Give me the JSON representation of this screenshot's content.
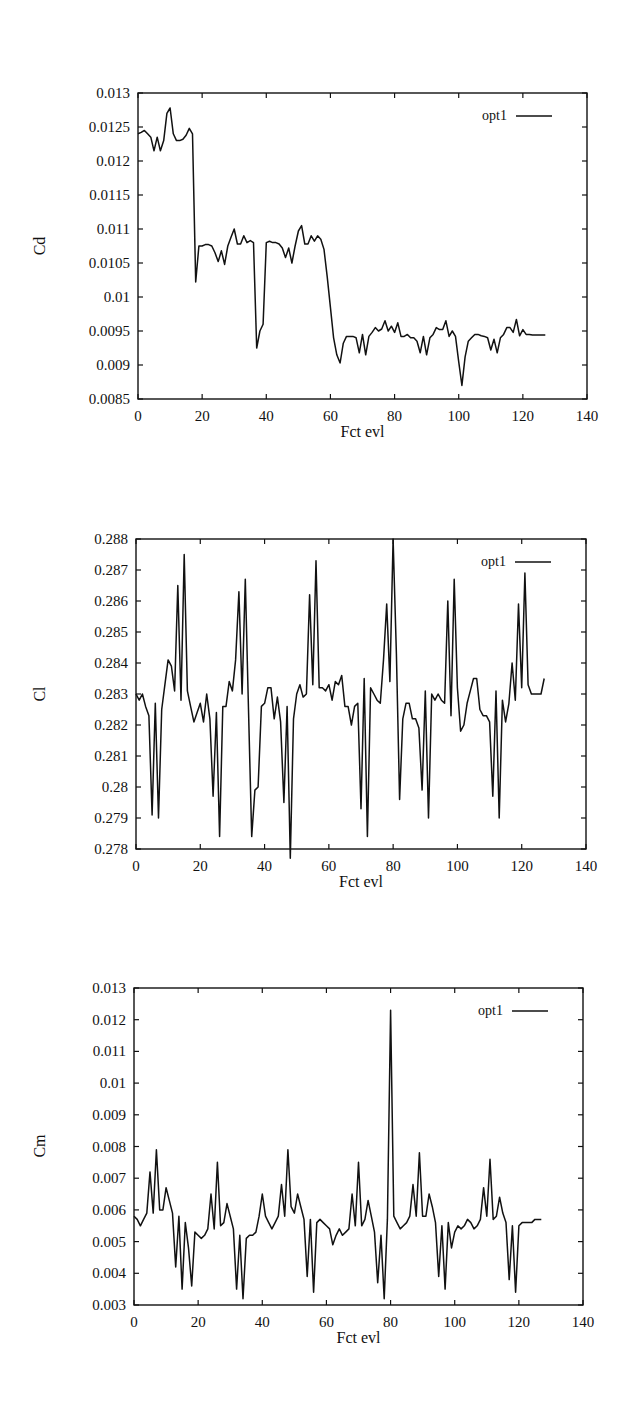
{
  "chart_data": [
    {
      "type": "line",
      "title": "",
      "xlabel": "Fct evl",
      "ylabel": "Cd",
      "xlim": [
        0,
        140
      ],
      "ylim": [
        0.0085,
        0.013
      ],
      "xticks": [
        "0",
        "20",
        "40",
        "60",
        "80",
        "100",
        "120",
        "140"
      ],
      "yticks": [
        "0.0085",
        "0.009",
        "0.0095",
        "0.01",
        "0.0105",
        "0.011",
        "0.0115",
        "0.012",
        "0.0125",
        "0.013"
      ],
      "grid": false,
      "legend_position": "top-right",
      "series": [
        {
          "name": "opt1",
          "x": [
            0,
            1,
            2,
            3,
            4,
            5,
            6,
            7,
            8,
            9,
            10,
            11,
            12,
            13,
            14,
            15,
            16,
            17,
            18,
            19,
            20,
            21,
            22,
            23,
            24,
            25,
            26,
            27,
            28,
            29,
            30,
            31,
            32,
            33,
            34,
            35,
            36,
            37,
            38,
            39,
            40,
            41,
            42,
            43,
            44,
            45,
            46,
            47,
            48,
            49,
            50,
            51,
            52,
            53,
            54,
            55,
            56,
            57,
            58,
            59,
            60,
            61,
            62,
            63,
            64,
            65,
            66,
            67,
            68,
            69,
            70,
            71,
            72,
            73,
            74,
            75,
            76,
            77,
            78,
            79,
            80,
            81,
            82,
            83,
            84,
            85,
            86,
            87,
            88,
            89,
            90,
            91,
            92,
            93,
            94,
            95,
            96,
            97,
            98,
            99,
            100,
            101,
            102,
            103,
            104,
            105,
            106,
            107,
            108,
            109,
            110,
            111,
            112,
            113,
            114,
            115,
            116,
            117,
            118,
            119,
            120,
            121,
            122,
            123,
            124,
            125,
            126,
            127
          ],
          "values": [
            0.0124,
            0.01242,
            0.01245,
            0.0124,
            0.01235,
            0.01215,
            0.01235,
            0.01215,
            0.0123,
            0.0127,
            0.01278,
            0.0124,
            0.0123,
            0.0123,
            0.01232,
            0.01238,
            0.01248,
            0.0124,
            0.01022,
            0.01075,
            0.01075,
            0.01077,
            0.01077,
            0.01075,
            0.01065,
            0.01052,
            0.01068,
            0.01048,
            0.01075,
            0.01088,
            0.011,
            0.01078,
            0.01078,
            0.0109,
            0.0108,
            0.01083,
            0.0108,
            0.00925,
            0.0095,
            0.0096,
            0.0108,
            0.01082,
            0.0108,
            0.0108,
            0.01078,
            0.01072,
            0.01058,
            0.01072,
            0.0105,
            0.01075,
            0.01097,
            0.01105,
            0.01078,
            0.01078,
            0.0109,
            0.01082,
            0.0109,
            0.01085,
            0.0107,
            0.0103,
            0.00985,
            0.0094,
            0.00915,
            0.00903,
            0.00932,
            0.00942,
            0.00942,
            0.00942,
            0.0094,
            0.00918,
            0.00945,
            0.00915,
            0.00942,
            0.00948,
            0.00955,
            0.0095,
            0.00953,
            0.00965,
            0.0095,
            0.00957,
            0.00948,
            0.00962,
            0.00942,
            0.00942,
            0.00945,
            0.0094,
            0.0094,
            0.00935,
            0.00918,
            0.00942,
            0.00915,
            0.0094,
            0.00945,
            0.00955,
            0.00952,
            0.00952,
            0.00965,
            0.00942,
            0.0095,
            0.00942,
            0.00905,
            0.0087,
            0.00912,
            0.00935,
            0.0094,
            0.00945,
            0.00945,
            0.00943,
            0.00942,
            0.0094,
            0.00922,
            0.00938,
            0.00918,
            0.0094,
            0.00945,
            0.00955,
            0.00955,
            0.00948,
            0.00967,
            0.00943,
            0.00952,
            0.00945,
            0.00945,
            0.00944,
            0.00944,
            0.00944,
            0.00944,
            0.00944
          ]
        }
      ]
    },
    {
      "type": "line",
      "title": "",
      "xlabel": "Fct evl",
      "ylabel": "Cl",
      "xlim": [
        0,
        140
      ],
      "ylim": [
        0.278,
        0.288
      ],
      "xticks": [
        "0",
        "20",
        "40",
        "60",
        "80",
        "100",
        "120",
        "140"
      ],
      "yticks": [
        "0.278",
        "0.279",
        "0.28",
        "0.281",
        "0.282",
        "0.283",
        "0.284",
        "0.285",
        "0.286",
        "0.287",
        "0.288"
      ],
      "grid": false,
      "legend_position": "top-right",
      "series": [
        {
          "name": "opt1",
          "x": [
            0,
            1,
            2,
            3,
            4,
            5,
            6,
            7,
            8,
            9,
            10,
            11,
            12,
            13,
            14,
            15,
            16,
            17,
            18,
            19,
            20,
            21,
            22,
            23,
            24,
            25,
            26,
            27,
            28,
            29,
            30,
            31,
            32,
            33,
            34,
            35,
            36,
            37,
            38,
            39,
            40,
            41,
            42,
            43,
            44,
            45,
            46,
            47,
            48,
            49,
            50,
            51,
            52,
            53,
            54,
            55,
            56,
            57,
            58,
            59,
            60,
            61,
            62,
            63,
            64,
            65,
            66,
            67,
            68,
            69,
            70,
            71,
            72,
            73,
            74,
            75,
            76,
            77,
            78,
            79,
            80,
            81,
            82,
            83,
            84,
            85,
            86,
            87,
            88,
            89,
            90,
            91,
            92,
            93,
            94,
            95,
            96,
            97,
            98,
            99,
            100,
            101,
            102,
            103,
            104,
            105,
            106,
            107,
            108,
            109,
            110,
            111,
            112,
            113,
            114,
            115,
            116,
            117,
            118,
            119,
            120,
            121,
            122,
            123,
            124,
            125,
            126,
            127
          ],
          "values": [
            0.283,
            0.2828,
            0.283,
            0.2826,
            0.2823,
            0.2791,
            0.2827,
            0.279,
            0.2825,
            0.2833,
            0.2841,
            0.2839,
            0.2831,
            0.2865,
            0.2828,
            0.2875,
            0.2831,
            0.2826,
            0.2821,
            0.2824,
            0.2827,
            0.2821,
            0.283,
            0.2822,
            0.2797,
            0.2824,
            0.2784,
            0.2826,
            0.2826,
            0.2834,
            0.2831,
            0.2841,
            0.2863,
            0.283,
            0.2867,
            0.2825,
            0.2784,
            0.2799,
            0.28,
            0.2826,
            0.2827,
            0.2832,
            0.2832,
            0.2822,
            0.2829,
            0.2821,
            0.2795,
            0.2826,
            0.2777,
            0.2822,
            0.283,
            0.2833,
            0.2829,
            0.283,
            0.2862,
            0.2833,
            0.2873,
            0.2832,
            0.2832,
            0.2831,
            0.2833,
            0.2828,
            0.2834,
            0.2833,
            0.2836,
            0.2826,
            0.2826,
            0.282,
            0.2826,
            0.2827,
            0.2793,
            0.2835,
            0.2784,
            0.2832,
            0.283,
            0.2828,
            0.2827,
            0.2841,
            0.2859,
            0.2834,
            0.288,
            0.2843,
            0.2796,
            0.2822,
            0.2827,
            0.2827,
            0.2822,
            0.2822,
            0.2819,
            0.2799,
            0.2831,
            0.279,
            0.283,
            0.2828,
            0.283,
            0.2828,
            0.2827,
            0.286,
            0.2823,
            0.2867,
            0.2832,
            0.2818,
            0.282,
            0.2827,
            0.2831,
            0.2835,
            0.2835,
            0.2825,
            0.2823,
            0.2823,
            0.2821,
            0.2797,
            0.2831,
            0.279,
            0.2828,
            0.2821,
            0.2827,
            0.284,
            0.2828,
            0.2859,
            0.2832,
            0.2869,
            0.2833,
            0.283,
            0.283,
            0.283,
            0.283,
            0.2835
          ]
        }
      ]
    },
    {
      "type": "line",
      "title": "",
      "xlabel": "Fct evl",
      "ylabel": "Cm",
      "xlim": [
        0,
        140
      ],
      "ylim": [
        0.003,
        0.013
      ],
      "xticks": [
        "0",
        "20",
        "40",
        "60",
        "80",
        "100",
        "120",
        "140"
      ],
      "yticks": [
        "0.003",
        "0.004",
        "0.005",
        "0.006",
        "0.007",
        "0.008",
        "0.009",
        "0.01",
        "0.011",
        "0.012",
        "0.013"
      ],
      "grid": false,
      "legend_position": "top-right",
      "series": [
        {
          "name": "opt1",
          "x": [
            0,
            1,
            2,
            3,
            4,
            5,
            6,
            7,
            8,
            9,
            10,
            11,
            12,
            13,
            14,
            15,
            16,
            17,
            18,
            19,
            20,
            21,
            22,
            23,
            24,
            25,
            26,
            27,
            28,
            29,
            30,
            31,
            32,
            33,
            34,
            35,
            36,
            37,
            38,
            39,
            40,
            41,
            42,
            43,
            44,
            45,
            46,
            47,
            48,
            49,
            50,
            51,
            52,
            53,
            54,
            55,
            56,
            57,
            58,
            59,
            60,
            61,
            62,
            63,
            64,
            65,
            66,
            67,
            68,
            69,
            70,
            71,
            72,
            73,
            74,
            75,
            76,
            77,
            78,
            79,
            80,
            81,
            82,
            83,
            84,
            85,
            86,
            87,
            88,
            89,
            90,
            91,
            92,
            93,
            94,
            95,
            96,
            97,
            98,
            99,
            100,
            101,
            102,
            103,
            104,
            105,
            106,
            107,
            108,
            109,
            110,
            111,
            112,
            113,
            114,
            115,
            116,
            117,
            118,
            119,
            120,
            121,
            122,
            123,
            124,
            125,
            126,
            127
          ],
          "values": [
            0.0058,
            0.0057,
            0.0055,
            0.0057,
            0.0059,
            0.0072,
            0.0059,
            0.0079,
            0.006,
            0.006,
            0.0067,
            0.0063,
            0.0059,
            0.0042,
            0.0058,
            0.0035,
            0.0056,
            0.0048,
            0.0036,
            0.0053,
            0.0052,
            0.0051,
            0.0052,
            0.0054,
            0.0065,
            0.0054,
            0.0075,
            0.0055,
            0.0056,
            0.0062,
            0.0058,
            0.0054,
            0.0035,
            0.0052,
            0.0032,
            0.0051,
            0.0052,
            0.0052,
            0.0053,
            0.0058,
            0.0065,
            0.0058,
            0.0056,
            0.0054,
            0.0056,
            0.0058,
            0.0068,
            0.0058,
            0.0079,
            0.0061,
            0.0059,
            0.0065,
            0.0061,
            0.0057,
            0.0039,
            0.0057,
            0.0034,
            0.0056,
            0.0057,
            0.0056,
            0.0055,
            0.0054,
            0.0049,
            0.0052,
            0.0054,
            0.0052,
            0.0053,
            0.0054,
            0.0065,
            0.0055,
            0.0075,
            0.0055,
            0.0057,
            0.0063,
            0.0058,
            0.0053,
            0.0037,
            0.0052,
            0.0032,
            0.0057,
            0.0123,
            0.0058,
            0.0056,
            0.0054,
            0.0055,
            0.0056,
            0.0058,
            0.0068,
            0.0058,
            0.0078,
            0.0058,
            0.0058,
            0.0065,
            0.0061,
            0.0056,
            0.0039,
            0.0055,
            0.0035,
            0.0056,
            0.0048,
            0.0053,
            0.0055,
            0.0054,
            0.0055,
            0.0057,
            0.0056,
            0.0054,
            0.0055,
            0.0057,
            0.0067,
            0.0058,
            0.0076,
            0.0057,
            0.0058,
            0.0064,
            0.0059,
            0.0056,
            0.0038,
            0.0055,
            0.0034,
            0.0055,
            0.0056,
            0.0056,
            0.0056,
            0.0056,
            0.0057,
            0.0057,
            0.0057
          ]
        }
      ]
    }
  ],
  "charts": [
    {
      "ylabel": "Cd",
      "xlabel": "Fct evl",
      "legend": "opt1"
    },
    {
      "ylabel": "Cl",
      "xlabel": "Fct evl",
      "legend": "opt1"
    },
    {
      "ylabel": "Cm",
      "xlabel": "Fct evl",
      "legend": "opt1"
    }
  ]
}
